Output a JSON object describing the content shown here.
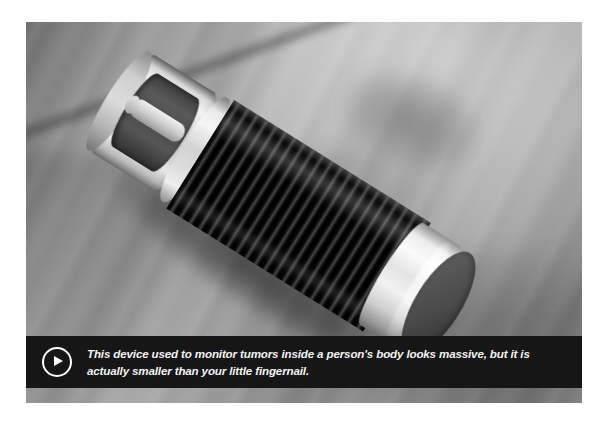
{
  "media": {
    "type": "photo-with-caption",
    "alt_description": "Close-up photograph of a small cylindrical coiled implant device lying on a grey surface",
    "subject": "coiled cylindrical medical implant device",
    "background": "blurred grey brushed surface"
  },
  "caption": {
    "play_icon": "play-circle-icon",
    "text": "This device used to monitor tumors inside a person's body looks massive, but it is actually smaller than your little fingernail.",
    "line_1": "This device used to monitor tumors inside a person's body looks massive, but it is",
    "line_2": "actually smaller than your little fingernail."
  },
  "colors": {
    "frame": "#ffffff",
    "caption_background": "#161616",
    "caption_text": "#f4f4f4",
    "photo_background": "#8e8e8e",
    "device_coil": "#0a0a0a",
    "device_cap": "#f2f2f2"
  }
}
